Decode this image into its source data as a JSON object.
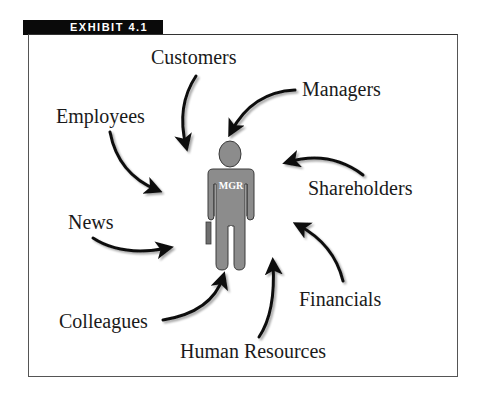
{
  "exhibit": {
    "label": "EXHIBIT 4.1"
  },
  "figure": {
    "center": {
      "label": "MGR",
      "body_color": "#8c8c8c",
      "outline_color": "#3a3a3a"
    },
    "sources": [
      {
        "id": "customers",
        "label": "Customers"
      },
      {
        "id": "managers",
        "label": "Managers"
      },
      {
        "id": "employees",
        "label": "Employees"
      },
      {
        "id": "shareholders",
        "label": "Shareholders"
      },
      {
        "id": "news",
        "label": "News"
      },
      {
        "id": "financials",
        "label": "Financials"
      },
      {
        "id": "colleagues",
        "label": "Colleagues"
      },
      {
        "id": "human-resources",
        "label": "Human Resources"
      }
    ],
    "arrow_color": "#111111"
  }
}
